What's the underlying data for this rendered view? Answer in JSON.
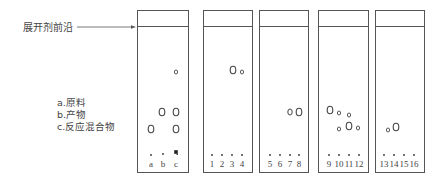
{
  "front_label": "展开剂前沿",
  "legend": {
    "items": [
      {
        "key": "a",
        "text": "a.原料"
      },
      {
        "key": "b",
        "text": "b.产物"
      },
      {
        "key": "c",
        "text": "c.反应混合物"
      }
    ]
  },
  "colors": {
    "line": "#555555",
    "text": "#444444",
    "background": "#ffffff"
  },
  "plates": [
    {
      "id": "plate-1",
      "box": {
        "x": 137,
        "y": 10,
        "w": 51,
        "h": 162
      },
      "front_y": 26,
      "lanes": [
        {
          "label": "a",
          "x": 151
        },
        {
          "label": "b",
          "x": 163
        },
        {
          "label": "c",
          "x": 176
        }
      ],
      "origin_markers": [
        {
          "x": 151,
          "y": 155,
          "type": "dot"
        },
        {
          "x": 163,
          "y": 154,
          "type": "dot"
        },
        {
          "x": 176,
          "y": 152,
          "type": "square"
        }
      ],
      "spots": [
        {
          "lane": "c",
          "x": 176,
          "y": 72,
          "size": "small"
        },
        {
          "lane": "b",
          "x": 162,
          "y": 112,
          "size": "large"
        },
        {
          "lane": "c",
          "x": 176,
          "y": 112,
          "size": "large"
        },
        {
          "lane": "a",
          "x": 151,
          "y": 129,
          "size": "large"
        },
        {
          "lane": "c",
          "x": 176,
          "y": 129,
          "size": "large"
        }
      ]
    },
    {
      "id": "plate-2",
      "box": {
        "x": 203,
        "y": 10,
        "w": 49,
        "h": 162
      },
      "front_y": 26,
      "lanes": [
        {
          "label": "1",
          "x": 212
        },
        {
          "label": "2",
          "x": 222
        },
        {
          "label": "3",
          "x": 232
        },
        {
          "label": "4",
          "x": 242
        }
      ],
      "origin_markers": [
        {
          "x": 212,
          "y": 155,
          "type": "dot"
        },
        {
          "x": 222,
          "y": 155,
          "type": "dot"
        },
        {
          "x": 232,
          "y": 155,
          "type": "dot"
        },
        {
          "x": 242,
          "y": 155,
          "type": "dot"
        }
      ],
      "spots": [
        {
          "lane": "3",
          "x": 233,
          "y": 70,
          "size": "large"
        },
        {
          "lane": "4",
          "x": 242,
          "y": 72,
          "size": "small"
        }
      ]
    },
    {
      "id": "plate-3",
      "box": {
        "x": 259,
        "y": 10,
        "w": 49,
        "h": 162
      },
      "front_y": 26,
      "lanes": [
        {
          "label": "5",
          "x": 270
        },
        {
          "label": "6",
          "x": 280
        },
        {
          "label": "7",
          "x": 290
        },
        {
          "label": "8",
          "x": 299
        }
      ],
      "origin_markers": [
        {
          "x": 270,
          "y": 155,
          "type": "dot"
        },
        {
          "x": 280,
          "y": 155,
          "type": "dot"
        },
        {
          "x": 290,
          "y": 155,
          "type": "dot"
        },
        {
          "x": 299,
          "y": 155,
          "type": "dot"
        }
      ],
      "spots": [
        {
          "lane": "7",
          "x": 290,
          "y": 112,
          "size": "medium"
        },
        {
          "lane": "8",
          "x": 299,
          "y": 112,
          "size": "large"
        }
      ]
    },
    {
      "id": "plate-4",
      "box": {
        "x": 318,
        "y": 10,
        "w": 50,
        "h": 162
      },
      "front_y": 26,
      "lanes": [
        {
          "label": "9",
          "x": 329
        },
        {
          "label": "10",
          "x": 339
        },
        {
          "label": "11",
          "x": 349
        },
        {
          "label": "12",
          "x": 359
        }
      ],
      "origin_markers": [
        {
          "x": 329,
          "y": 155,
          "type": "dot"
        },
        {
          "x": 339,
          "y": 155,
          "type": "dot"
        },
        {
          "x": 349,
          "y": 155,
          "type": "dot"
        },
        {
          "x": 359,
          "y": 155,
          "type": "dot"
        }
      ],
      "spots": [
        {
          "lane": "9",
          "x": 330,
          "y": 110,
          "size": "large"
        },
        {
          "lane": "10",
          "x": 339,
          "y": 113,
          "size": "small"
        },
        {
          "lane": "11",
          "x": 349,
          "y": 115,
          "size": "small"
        },
        {
          "lane": "10",
          "x": 339,
          "y": 129,
          "size": "small"
        },
        {
          "lane": "11",
          "x": 349,
          "y": 126,
          "size": "large"
        },
        {
          "lane": "12",
          "x": 358,
          "y": 128,
          "size": "small"
        }
      ]
    },
    {
      "id": "plate-5",
      "box": {
        "x": 375,
        "y": 10,
        "w": 49,
        "h": 162
      },
      "front_y": 26,
      "lanes": [
        {
          "label": "13",
          "x": 384
        },
        {
          "label": "14",
          "x": 394
        },
        {
          "label": "15",
          "x": 404
        },
        {
          "label": "16",
          "x": 414
        }
      ],
      "origin_markers": [
        {
          "x": 384,
          "y": 155,
          "type": "dot"
        },
        {
          "x": 394,
          "y": 155,
          "type": "dot"
        },
        {
          "x": 404,
          "y": 155,
          "type": "dot"
        },
        {
          "x": 414,
          "y": 155,
          "type": "dot"
        }
      ],
      "spots": [
        {
          "lane": "13",
          "x": 388,
          "y": 130,
          "size": "small"
        },
        {
          "lane": "14",
          "x": 396,
          "y": 127,
          "size": "large"
        }
      ]
    }
  ],
  "arrow": {
    "x1": 77,
    "y1": 27,
    "x2": 136,
    "y2": 27
  }
}
